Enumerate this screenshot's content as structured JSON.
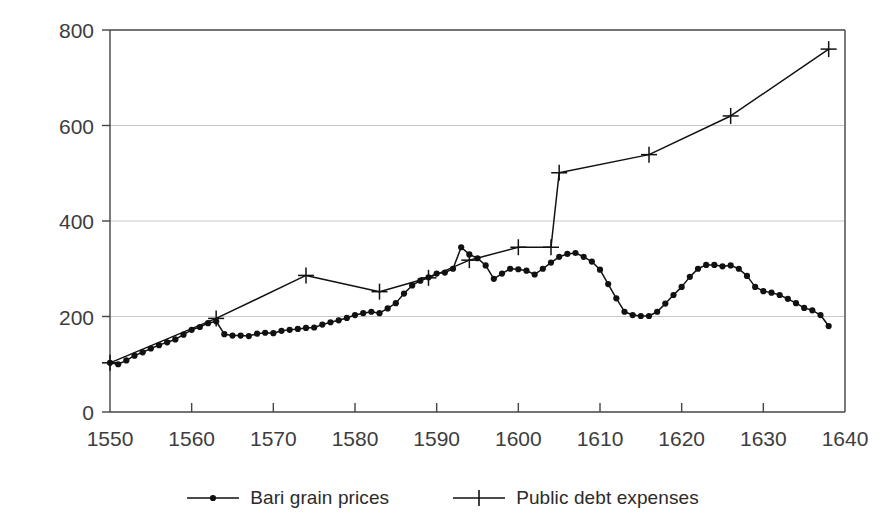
{
  "chart_data": {
    "type": "line",
    "title": "",
    "xlabel": "",
    "ylabel": "",
    "xlim": [
      1550,
      1640
    ],
    "ylim": [
      0,
      800
    ],
    "xticks": [
      1550,
      1560,
      1570,
      1580,
      1590,
      1600,
      1610,
      1620,
      1630,
      1640
    ],
    "yticks": [
      0,
      200,
      400,
      600,
      800
    ],
    "grid": "horizontal",
    "legend_position": "bottom",
    "series": [
      {
        "name": "Bari grain prices",
        "marker": "dot",
        "color": "#111111",
        "x": [
          1550,
          1551,
          1552,
          1553,
          1554,
          1555,
          1556,
          1557,
          1558,
          1559,
          1560,
          1561,
          1562,
          1563,
          1564,
          1565,
          1566,
          1567,
          1568,
          1569,
          1570,
          1571,
          1572,
          1573,
          1574,
          1575,
          1576,
          1577,
          1578,
          1579,
          1580,
          1581,
          1582,
          1583,
          1584,
          1585,
          1586,
          1587,
          1588,
          1589,
          1590,
          1591,
          1592,
          1593,
          1594,
          1595,
          1596,
          1597,
          1598,
          1599,
          1600,
          1601,
          1602,
          1603,
          1604,
          1605,
          1606,
          1607,
          1608,
          1609,
          1610,
          1611,
          1612,
          1613,
          1614,
          1615,
          1616,
          1617,
          1618,
          1619,
          1620,
          1621,
          1622,
          1623,
          1624,
          1625,
          1626,
          1627,
          1628,
          1629,
          1630,
          1631,
          1632,
          1633,
          1634,
          1635,
          1636,
          1637,
          1638
        ],
        "values": [
          103,
          100,
          108,
          118,
          125,
          133,
          140,
          146,
          152,
          162,
          172,
          178,
          186,
          190,
          163,
          160,
          160,
          159,
          164,
          166,
          165,
          170,
          172,
          174,
          176,
          177,
          183,
          188,
          192,
          197,
          203,
          207,
          210,
          207,
          217,
          228,
          248,
          265,
          275,
          282,
          290,
          292,
          300,
          345,
          330,
          322,
          307,
          279,
          290,
          300,
          299,
          296,
          288,
          300,
          313,
          325,
          331,
          333,
          325,
          315,
          298,
          268,
          238,
          210,
          203,
          201,
          201,
          210,
          227,
          245,
          262,
          283,
          300,
          308,
          308,
          305,
          307,
          300,
          285,
          262,
          253,
          250,
          245,
          237,
          228,
          218,
          213,
          203,
          180
        ]
      },
      {
        "name": "Public debt expenses",
        "marker": "plus",
        "color": "#111111",
        "x": [
          1550,
          1563,
          1574,
          1583,
          1589,
          1594,
          1600,
          1604,
          1605,
          1616,
          1626,
          1638
        ],
        "values": [
          103,
          196,
          286,
          252,
          281,
          318,
          345,
          345,
          501,
          539,
          620,
          760
        ]
      }
    ]
  },
  "axes": {
    "ytick_labels": [
      "0",
      "200",
      "400",
      "600",
      "800"
    ],
    "xtick_labels": [
      "1550",
      "1560",
      "1570",
      "1580",
      "1590",
      "1600",
      "1610",
      "1620",
      "1630",
      "1640"
    ]
  },
  "legend": {
    "entries": [
      {
        "label": "Bari grain prices",
        "marker": "dot-line-marker"
      },
      {
        "label": "Public debt expenses",
        "marker": "plus-line-marker"
      }
    ]
  },
  "colors": {
    "series_line": "#111111",
    "axis": "#444444",
    "gridline": "#c8c8c8",
    "tick_text": "#3d3d3d"
  }
}
